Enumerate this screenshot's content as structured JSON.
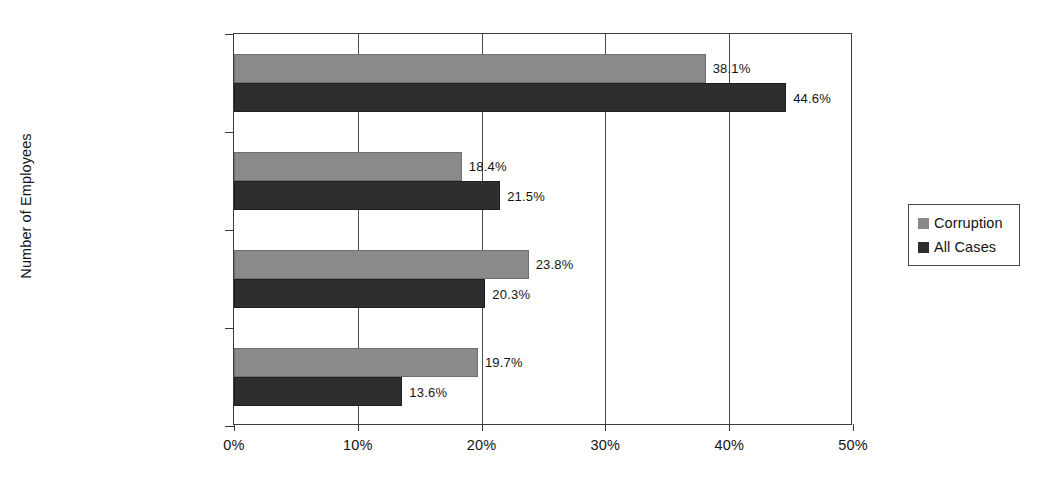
{
  "chart_data": {
    "type": "bar",
    "orientation": "horizontal",
    "title": "",
    "xlabel": "",
    "ylabel": "Number of Employees",
    "xlim": [
      0,
      50
    ],
    "xtick_labels": [
      "0%",
      "10%",
      "20%",
      "30%",
      "40%",
      "50%"
    ],
    "xtick_values": [
      0,
      10,
      20,
      30,
      40,
      50
    ],
    "grid": true,
    "grid_axis": "x",
    "legend_position": "right",
    "categories": [
      "1 - 99",
      "100 - 999",
      "1,000 - 9,999",
      "10,000+"
    ],
    "series": [
      {
        "name": "Corruption",
        "color": "#8a8a8a",
        "values": [
          38.1,
          18.4,
          23.8,
          19.7
        ],
        "data_labels": [
          "38.1%",
          "18.4%",
          "23.8%",
          "19.7%"
        ]
      },
      {
        "name": "All Cases",
        "color": "#2e2e2e",
        "values": [
          44.6,
          21.5,
          20.3,
          13.6
        ],
        "data_labels": [
          "44.6%",
          "21.5%",
          "20.3%",
          "13.6%"
        ]
      }
    ]
  },
  "legend": {
    "entries": [
      {
        "label": "Corruption",
        "color": "#8a8a8a"
      },
      {
        "label": "All Cases",
        "color": "#2e2e2e"
      }
    ]
  }
}
